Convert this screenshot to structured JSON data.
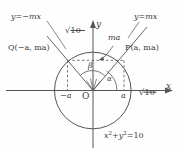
{
  "figure": {
    "name": "circle-with-two-rays-diagram",
    "axes": {
      "x_label": "x",
      "y_label": "y",
      "origin_label": "O"
    },
    "circle": {
      "equation_parts": {
        "x": "x",
        "sup1": "2",
        "plus": "+",
        "y": "y",
        "sup2": "2",
        "eq": "=10"
      },
      "equation_text": "x2+y2=10",
      "radius_label_axis": "10",
      "radius_label_upper": "10",
      "radius_symbol": "√"
    },
    "lines": {
      "left_ray_label": "y=−mx",
      "right_ray_label": "y=mx"
    },
    "points": {
      "p_label": "P(a, ma)",
      "q_label": "Q(−a, ma)"
    },
    "ticks": {
      "neg_a": "−a",
      "pos_a": "a",
      "ma": "ma"
    },
    "angles": {
      "alpha": "α",
      "beta": "β"
    },
    "colors": {
      "stroke": "#555555",
      "text": "#3c3c3c",
      "background": "#fefefe"
    }
  }
}
